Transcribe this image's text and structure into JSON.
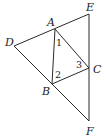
{
  "diagram": {
    "type": "geometry",
    "stroke_color": "#2a2a2a",
    "points": {
      "A": {
        "label": "A",
        "x": 55,
        "y": 29,
        "label_x": 47,
        "label_y": 26
      },
      "B": {
        "label": "B",
        "x": 52,
        "y": 84,
        "label_x": 42,
        "label_y": 95
      },
      "C": {
        "label": "C",
        "x": 89,
        "y": 68,
        "label_x": 93,
        "label_y": 73
      },
      "D": {
        "label": "D",
        "x": 14,
        "y": 46,
        "label_x": 5,
        "label_y": 46
      },
      "E": {
        "label": "E",
        "x": 89,
        "y": 14,
        "label_x": 86,
        "label_y": 11
      },
      "F": {
        "label": "F",
        "x": 89,
        "y": 121,
        "label_x": 86,
        "label_y": 135
      }
    },
    "segments": [
      {
        "from": "D",
        "to": "E"
      },
      {
        "from": "D",
        "to": "F"
      },
      {
        "from": "E",
        "to": "F"
      },
      {
        "from": "A",
        "to": "B"
      },
      {
        "from": "A",
        "to": "C"
      },
      {
        "from": "B",
        "to": "C"
      }
    ],
    "angle_labels": [
      {
        "text": "1",
        "x": 56,
        "y": 46
      },
      {
        "text": "2",
        "x": 55,
        "y": 78
      },
      {
        "text": "3",
        "x": 76,
        "y": 68
      }
    ]
  }
}
